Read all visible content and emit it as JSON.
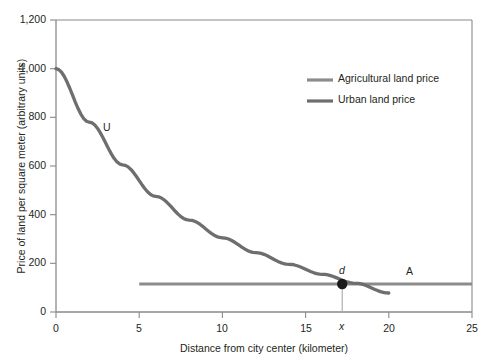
{
  "chart_data": {
    "type": "line",
    "title": "",
    "xlabel": "Distance from city center (kilometer)",
    "ylabel": "Price of land per square meter (arbitrary units)",
    "xlim": [
      0,
      25
    ],
    "ylim": [
      0,
      1200
    ],
    "xticks": [
      "0",
      "5",
      "10",
      "15",
      "20",
      "25"
    ],
    "xtick_values": [
      0,
      5,
      10,
      15,
      20,
      25
    ],
    "yticks": [
      "0",
      "200",
      "400",
      "600",
      "800",
      "1,000",
      "1,200"
    ],
    "ytick_values": [
      0,
      200,
      400,
      600,
      800,
      1000,
      1200
    ],
    "grid": false,
    "legend_position": "upper right",
    "series": [
      {
        "name": "Agricultural land price",
        "color": "#8c8c8c",
        "type": "line",
        "x": [
          5,
          10,
          15,
          20,
          25
        ],
        "values": [
          115,
          115,
          115,
          115,
          115
        ]
      },
      {
        "name": "Urban land price",
        "color": "#6e6e6e",
        "type": "line",
        "x": [
          0,
          2,
          4,
          6,
          8,
          10,
          12,
          14,
          16,
          18,
          20
        ],
        "values": [
          1000,
          780,
          605,
          475,
          378,
          305,
          244,
          196,
          155,
          118,
          78
        ]
      }
    ],
    "annotations": [
      {
        "text": "U",
        "x": 3.1,
        "y": 745,
        "style": "normal"
      },
      {
        "text": "A",
        "x": 21.3,
        "y": 165,
        "style": "normal"
      },
      {
        "text": "d",
        "x": 16.8,
        "y": 185,
        "style": "italic"
      },
      {
        "text": "x",
        "x": 17.2,
        "y": -75,
        "style": "italic"
      }
    ],
    "markers": [
      {
        "label": "d",
        "x": 17.2,
        "y": 115,
        "color": "#1a1a1a"
      }
    ]
  },
  "legend": {
    "items": [
      {
        "label": "Agricultural land price",
        "color": "#8c8c8c"
      },
      {
        "label": "Urban land price",
        "color": "#6e6e6e"
      }
    ]
  },
  "axis": {
    "x_label": "Distance from city center (kilometer)",
    "y_label": "Price of land per square meter (arbitrary units)",
    "x_ticks": [
      "0",
      "5",
      "10",
      "15",
      "20",
      "25"
    ],
    "y_ticks": [
      "1,200",
      "1,000",
      "800",
      "600",
      "400",
      "200",
      "0"
    ]
  },
  "labels": {
    "urban_curve": "U",
    "agricultural_region": "A",
    "intersection_point": "d",
    "intersection_x": "x"
  },
  "colors": {
    "agricultural": "#8c8c8c",
    "urban": "#6e6e6e",
    "axis": "#8a8a8a",
    "frame": "#8a8a8a",
    "marker": "#1a1a1a",
    "text": "#231f20",
    "background": "#ffffff"
  }
}
